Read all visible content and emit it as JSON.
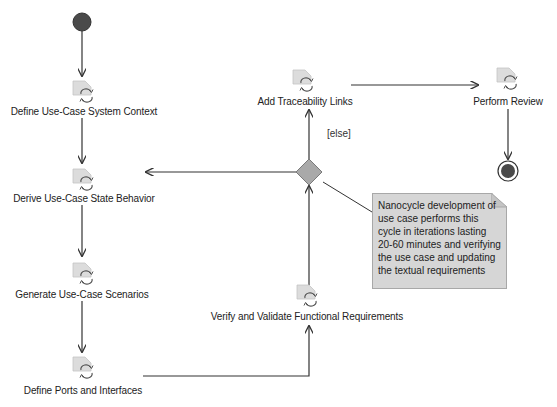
{
  "diagram": {
    "type": "UML activity diagram",
    "actions": [
      {
        "id": "a1",
        "label": "Define Use-Case System Context",
        "icon": "call-behavior-action-icon"
      },
      {
        "id": "a2",
        "label": "Derive Use-Case State Behavior",
        "icon": "call-behavior-action-icon"
      },
      {
        "id": "a3",
        "label": "Generate Use-Case Scenarios",
        "icon": "call-behavior-action-icon"
      },
      {
        "id": "a4",
        "label": "Define Ports and Interfaces",
        "icon": "call-behavior-action-icon"
      },
      {
        "id": "a5",
        "label": "Verify and Validate Functional Requirements",
        "icon": "call-behavior-action-icon"
      },
      {
        "id": "a6",
        "label": "Add Traceability Links",
        "icon": "call-behavior-action-icon"
      },
      {
        "id": "a7",
        "label": "Perform Review",
        "icon": "call-behavior-action-icon"
      }
    ],
    "decision": {
      "guard": "[else]"
    },
    "note": {
      "lines": [
        "Nanocycle development of",
        "use case performs this",
        "cycle in iterations lasting",
        "20-60 minutes and verifying",
        "the use case and updating",
        "the textual requirements"
      ]
    },
    "flows": [
      {
        "from": "initial",
        "to": "a1"
      },
      {
        "from": "a1",
        "to": "a2"
      },
      {
        "from": "a2",
        "to": "a3"
      },
      {
        "from": "a3",
        "to": "a4"
      },
      {
        "from": "a4",
        "to": "a5"
      },
      {
        "from": "a5",
        "to": "decision"
      },
      {
        "from": "decision",
        "to": "a2"
      },
      {
        "from": "decision",
        "to": "a6",
        "guard": "[else]"
      },
      {
        "from": "a6",
        "to": "a7"
      },
      {
        "from": "a7",
        "to": "final"
      }
    ],
    "colors": {
      "initial_node": "#4a4a4a",
      "final_node": "#4a4a4a",
      "decision_fill": "#a9a9a9",
      "note_fill": "#d6d6d6",
      "line": "#333333"
    }
  }
}
